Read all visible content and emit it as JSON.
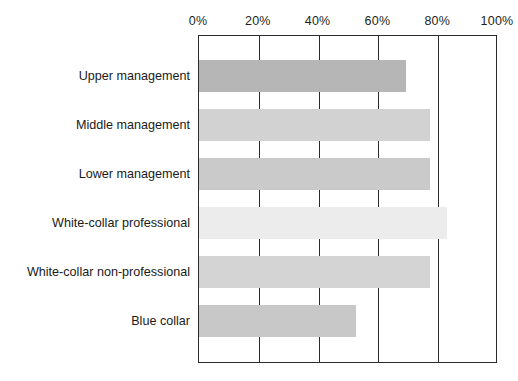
{
  "chart_data": {
    "type": "bar",
    "orientation": "horizontal",
    "title": "",
    "xlabel": "",
    "ylabel": "",
    "xlim": [
      0,
      100
    ],
    "xticks": [
      0,
      20,
      40,
      60,
      80,
      100
    ],
    "xtick_labels": [
      "0%",
      "20%",
      "40%",
      "60%",
      "80%",
      "100%"
    ],
    "grid": true,
    "legend": null,
    "categories": [
      "Upper management",
      "Middle management",
      "Lower management",
      "White-collar professional",
      "White-collar non-professional",
      "Blue collar"
    ],
    "values": [
      70,
      78,
      78,
      84,
      78,
      53
    ],
    "bar_colors": [
      "#b6b6b6",
      "#d2d2d2",
      "#cacaca",
      "#ececec",
      "#d4d4d4",
      "#c8c8c8"
    ]
  },
  "axis": {
    "tick_0": "0%",
    "tick_1": "20%",
    "tick_2": "40%",
    "tick_3": "60%",
    "tick_4": "80%",
    "tick_5": "100%"
  },
  "categories": {
    "c0": "Upper management",
    "c1": "Middle management",
    "c2": "Lower management",
    "c3": "White-collar professional",
    "c4": "White-collar non-professional",
    "c5": "Blue collar"
  }
}
